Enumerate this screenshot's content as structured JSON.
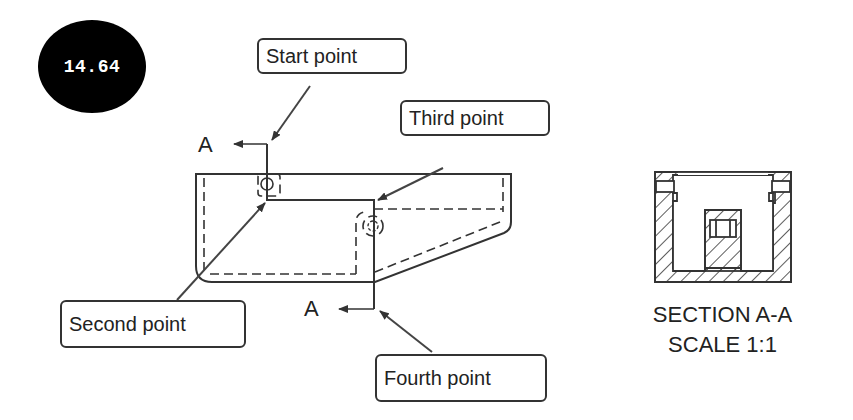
{
  "figure_number": "14.64",
  "callouts": {
    "start": "Start point",
    "second": "Second point",
    "third": "Third point",
    "fourth": "Fourth point"
  },
  "section_labels": {
    "top_arrow": "A",
    "bottom_arrow": "A"
  },
  "section_view": {
    "title": "SECTION A-A",
    "scale": "SCALE 1:1"
  },
  "colors": {
    "line": "#333333",
    "badge": "#000000",
    "badge_text": "#ffffff"
  }
}
